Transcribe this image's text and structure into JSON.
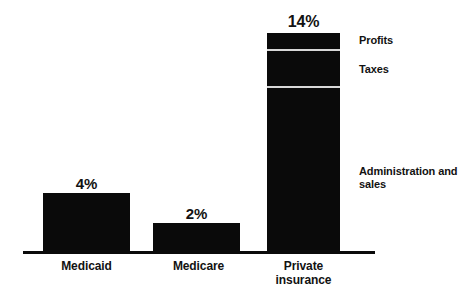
{
  "chart_data": {
    "type": "bar",
    "title": "",
    "subtitle": "",
    "xlabel": "",
    "ylabel": "",
    "grid": false,
    "legend_position": "right-inline-callouts",
    "ylim": [
      0,
      14
    ],
    "categories": [
      "Medicaid",
      "Medicare",
      "Private insurance"
    ],
    "values": [
      4,
      2,
      14
    ],
    "value_labels": [
      "4%",
      "2%",
      "14%"
    ],
    "stacked_bar": {
      "category": "Private insurance",
      "total": 14,
      "total_label": "14%",
      "segments": [
        {
          "name": "Profits",
          "label": "Profits"
        },
        {
          "name": "Taxes",
          "label": "Taxes"
        },
        {
          "name": "Administration and sales",
          "label": "Administration and sales"
        }
      ]
    },
    "colors": {
      "bar_fill": "#0a0a0a",
      "axis": "#0a0a0a",
      "segment_divider": "#d8d8d8",
      "text": "#121212",
      "background": "#ffffff"
    }
  },
  "bars": {
    "medicaid": {
      "category": "Medicaid",
      "value_label": "4%"
    },
    "medicare": {
      "category": "Medicare",
      "value_label": "2%"
    },
    "private": {
      "category_line1": "Private",
      "category_line2": "insurance",
      "value_label": "14%"
    }
  },
  "segment_callouts": {
    "profits": "Profits",
    "taxes": "Taxes",
    "administration": "Administration and sales"
  }
}
